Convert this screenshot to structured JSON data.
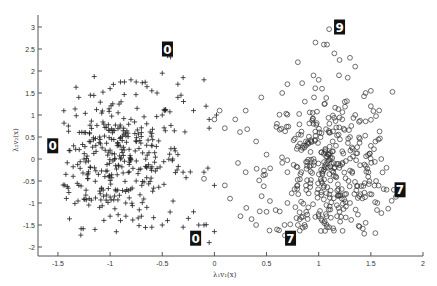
{
  "chart_data": {
    "type": "scatter",
    "title": "",
    "xlabel": "λ₁v₁(x)",
    "ylabel": "λ₂v₂(x)",
    "xlim": [
      -1.65,
      2.0
    ],
    "ylim": [
      -2.2,
      3.3
    ],
    "xticks": [
      -1.5,
      -1,
      -0.5,
      0,
      0.5,
      1,
      1.5,
      2
    ],
    "xtick_labels": [
      "-1.5",
      "-1",
      "-0.5",
      "0",
      "0.5",
      "1",
      "1.5",
      "2"
    ],
    "yticks": [
      -2,
      -1.5,
      -1,
      -0.5,
      0,
      0.5,
      1,
      1.5,
      2,
      2.5,
      3
    ],
    "ytick_labels": [
      "-2",
      "-1.5",
      "-1",
      "-0.5",
      "0",
      "0.5",
      "1",
      "1.5",
      "2",
      "2.5",
      "3"
    ],
    "grid": false,
    "legend": null,
    "series": [
      {
        "name": "class-0 (plus markers)",
        "marker": "+",
        "color": "#222222",
        "cluster": {
          "center": [
            -0.95,
            0.0
          ],
          "spread": [
            0.32,
            0.75
          ],
          "count": 380,
          "x_range": [
            -1.45,
            0.05
          ],
          "y_range": [
            -1.9,
            2.4
          ]
        },
        "points": [
          [
            -0.45,
            2.35
          ],
          [
            -0.42,
            2.32
          ],
          [
            -0.5,
            1.95
          ],
          [
            -0.3,
            1.85
          ],
          [
            -0.1,
            1.8
          ],
          [
            -0.35,
            1.7
          ],
          [
            -0.9,
            1.75
          ],
          [
            -0.8,
            1.8
          ],
          [
            -0.75,
            1.75
          ],
          [
            -1.0,
            1.6
          ],
          [
            -1.3,
            1.4
          ],
          [
            -0.6,
            1.55
          ],
          [
            -0.55,
            1.5
          ],
          [
            -0.35,
            1.4
          ],
          [
            -0.32,
            1.45
          ],
          [
            -0.08,
            1.2
          ],
          [
            -0.05,
            0.9
          ],
          [
            -0.2,
            1.1
          ],
          [
            -1.4,
            0.75
          ],
          [
            -1.35,
            0.3
          ],
          [
            -1.2,
            0.4
          ],
          [
            -1.1,
            0.5
          ],
          [
            -1.0,
            0.2
          ],
          [
            -0.9,
            0.0
          ],
          [
            -1.25,
            0.0
          ],
          [
            -1.15,
            -0.2
          ],
          [
            -1.3,
            -0.6
          ],
          [
            -1.05,
            -0.4
          ],
          [
            -0.95,
            -0.7
          ],
          [
            -0.85,
            -1.0
          ],
          [
            -0.7,
            -1.3
          ],
          [
            -0.6,
            -1.55
          ],
          [
            -0.5,
            -1.5
          ],
          [
            -0.45,
            -1.4
          ],
          [
            -0.3,
            -1.55
          ],
          [
            -0.25,
            -1.35
          ],
          [
            -0.15,
            -1.5
          ],
          [
            -0.1,
            -1.5
          ],
          [
            -0.05,
            -1.9
          ],
          [
            0.0,
            -1.65
          ],
          [
            -0.2,
            -1.2
          ],
          [
            -0.3,
            -0.3
          ],
          [
            -0.35,
            0.1
          ],
          [
            -0.4,
            0.0
          ],
          [
            -0.6,
            0.3
          ],
          [
            -0.7,
            0.6
          ],
          [
            -0.8,
            0.9
          ],
          [
            -0.5,
            1.0
          ],
          [
            -0.65,
            -0.2
          ],
          [
            -0.75,
            -0.5
          ],
          [
            -1.2,
            -0.9
          ],
          [
            -1.1,
            -1.1
          ],
          [
            -1.0,
            -1.3
          ],
          [
            -0.9,
            -1.4
          ],
          [
            0.0,
            -0.6
          ],
          [
            -0.1,
            -0.3
          ],
          [
            -0.05,
            0.7
          ],
          [
            0.02,
            1.0
          ]
        ],
        "color_hex": "#222222"
      },
      {
        "name": "class-7/9 (circle markers)",
        "marker": "o",
        "color": "#333333",
        "cluster": {
          "center": [
            1.1,
            -0.3
          ],
          "spread": [
            0.3,
            0.9
          ],
          "count": 420,
          "x_range": [
            0.15,
            1.75
          ],
          "y_range": [
            -1.75,
            2.95
          ]
        },
        "points": [
          [
            1.1,
            2.95
          ],
          [
            1.05,
            2.6
          ],
          [
            1.08,
            2.6
          ],
          [
            1.15,
            2.4
          ],
          [
            1.2,
            2.25
          ],
          [
            1.3,
            2.3
          ],
          [
            0.8,
            2.2
          ],
          [
            1.35,
            2.1
          ],
          [
            0.95,
            1.9
          ],
          [
            1.0,
            1.8
          ],
          [
            0.7,
            1.7
          ],
          [
            0.65,
            1.5
          ],
          [
            1.45,
            1.5
          ],
          [
            1.5,
            1.55
          ],
          [
            1.5,
            1.2
          ],
          [
            0.45,
            1.4
          ],
          [
            0.3,
            1.1
          ],
          [
            0.2,
            0.9
          ],
          [
            0.1,
            0.7
          ],
          [
            0.05,
            1.1
          ],
          [
            0.95,
            0.8
          ],
          [
            1.1,
            0.6
          ],
          [
            1.3,
            0.5
          ],
          [
            1.5,
            0.3
          ],
          [
            1.6,
            0.0
          ],
          [
            1.65,
            -0.2
          ],
          [
            1.55,
            -0.5
          ],
          [
            1.4,
            -0.8
          ],
          [
            1.3,
            -1.0
          ],
          [
            1.2,
            -1.2
          ],
          [
            1.0,
            -1.3
          ],
          [
            0.9,
            -1.1
          ],
          [
            0.7,
            -1.0
          ],
          [
            0.5,
            -1.2
          ],
          [
            0.4,
            -1.5
          ],
          [
            0.25,
            -1.3
          ],
          [
            0.15,
            -0.9
          ],
          [
            0.1,
            -0.6
          ],
          [
            0.3,
            -0.3
          ],
          [
            0.5,
            0.1
          ],
          [
            0.7,
            -0.3
          ],
          [
            0.85,
            0.3
          ],
          [
            0.6,
            -1.6
          ],
          [
            0.62,
            -1.62
          ],
          [
            0.8,
            -1.5
          ],
          [
            1.1,
            -1.55
          ],
          [
            1.45,
            -1.45
          ],
          [
            1.7,
            -0.95
          ],
          [
            1.72,
            -0.7
          ],
          [
            1.35,
            1.0
          ],
          [
            1.25,
            1.3
          ],
          [
            0.6,
            0.8
          ],
          [
            0.4,
            0.4
          ],
          [
            0.0,
            0.9
          ],
          [
            -0.1,
            -0.45
          ]
        ],
        "color_hex": "#333333"
      }
    ],
    "annotations": [
      {
        "type": "digit-thumbnail",
        "label": "0",
        "data_xy": [
          -0.45,
          2.5
        ],
        "near_point": [
          -0.4,
          2.35
        ]
      },
      {
        "type": "digit-thumbnail",
        "label": "0",
        "data_xy": [
          -1.55,
          0.3
        ],
        "near_point": [
          -1.5,
          0.25
        ]
      },
      {
        "type": "digit-thumbnail",
        "label": "0",
        "data_xy": [
          -0.18,
          -1.8
        ],
        "near_point": [
          -0.15,
          -1.7
        ]
      },
      {
        "type": "digit-thumbnail",
        "label": "7",
        "data_xy": [
          0.73,
          -1.8
        ],
        "near_point": [
          0.65,
          -1.65
        ]
      },
      {
        "type": "digit-thumbnail",
        "label": "7",
        "data_xy": [
          1.78,
          -0.7
        ],
        "near_point": [
          1.72,
          -0.7
        ]
      },
      {
        "type": "digit-thumbnail",
        "label": "9",
        "data_xy": [
          1.2,
          3.0
        ],
        "near_point": [
          1.1,
          2.95
        ]
      }
    ]
  },
  "axes": {
    "x_label": "λ₁v₁(x)",
    "y_label": "λ₂v₂(x)"
  }
}
